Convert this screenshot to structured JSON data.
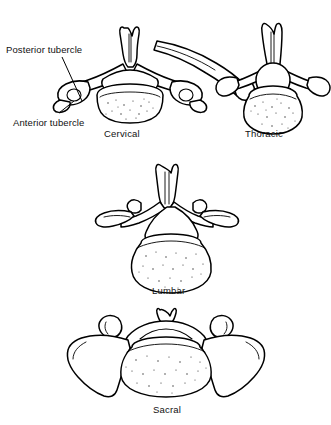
{
  "figure": {
    "background_color": "#ffffff",
    "ink_color": "#000000",
    "width": 331,
    "height": 425
  },
  "annotations": [
    {
      "id": "posterior-tubercle",
      "label": "Posterior tubercle",
      "points_to": "cervical vertebra posterior tubercle of transverse process"
    },
    {
      "id": "anterior-tubercle",
      "label": "Anterior tubercle",
      "points_to": "cervical vertebra anterior tubercle of transverse process"
    }
  ],
  "panels": [
    {
      "id": "cervical",
      "caption": "Cervical",
      "position": "top-left",
      "features": "bifid spinous process, transverse foramina, small oval body"
    },
    {
      "id": "thoracic",
      "caption": "Thoracic",
      "position": "top-right",
      "features": "long downward spinous process, costal facets, articulated rib"
    },
    {
      "id": "lumbar",
      "caption": "Lumbar",
      "position": "middle",
      "features": "large kidney-shaped body, mammillary processes, triangular foramen"
    },
    {
      "id": "sacral",
      "caption": "Sacral",
      "position": "bottom",
      "features": "broad lateral alae with hatched shading, wide body, sacral canal"
    }
  ]
}
